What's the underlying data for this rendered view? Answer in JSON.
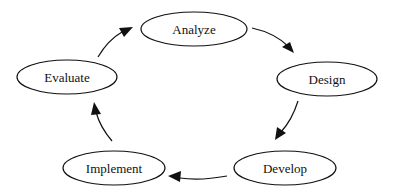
{
  "diagram": {
    "type": "cycle",
    "colors": {
      "stroke": "#111111",
      "background": "#ffffff",
      "node_fill": "#ffffff"
    },
    "nodes": [
      {
        "id": "analyze",
        "label": "Analyze",
        "cx": 194,
        "cy": 29,
        "rx": 53,
        "ry": 17
      },
      {
        "id": "design",
        "label": "Design",
        "cx": 327,
        "cy": 79,
        "rx": 50,
        "ry": 17
      },
      {
        "id": "develop",
        "label": "Develop",
        "cx": 285,
        "cy": 168,
        "rx": 51,
        "ry": 17
      },
      {
        "id": "implement",
        "label": "Implement",
        "cx": 114,
        "cy": 168,
        "rx": 51,
        "ry": 17
      },
      {
        "id": "evaluate",
        "label": "Evaluate",
        "cx": 67,
        "cy": 77,
        "rx": 50,
        "ry": 17
      }
    ],
    "edges": [
      {
        "from": "analyze",
        "to": "design"
      },
      {
        "from": "design",
        "to": "develop"
      },
      {
        "from": "develop",
        "to": "implement"
      },
      {
        "from": "implement",
        "to": "evaluate"
      },
      {
        "from": "evaluate",
        "to": "analyze"
      }
    ]
  }
}
